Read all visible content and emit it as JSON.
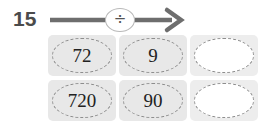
{
  "worksheet": {
    "row_label": "15",
    "operation": {
      "symbol": "÷",
      "icon": "divide-icon",
      "arrow_icon": "right-arrow-icon"
    },
    "rows": [
      {
        "cells": [
          {
            "value": "72",
            "filled": true
          },
          {
            "value": "9",
            "filled": true
          },
          {
            "value": "",
            "filled": false
          }
        ]
      },
      {
        "cells": [
          {
            "value": "720",
            "filled": true
          },
          {
            "value": "90",
            "filled": true
          },
          {
            "value": "",
            "filled": false
          }
        ]
      }
    ],
    "colors": {
      "background": "#ffffff",
      "cell_fill": "#e8e8e8",
      "cell_blank_fill": "#ededed",
      "dash_border": "#8d8d8d",
      "arrow": "#6e6e6e",
      "label_text": "#4b4b4b",
      "value_text": "#222222"
    }
  }
}
